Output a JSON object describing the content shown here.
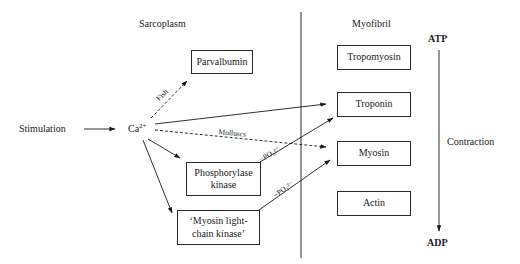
{
  "diagram": {
    "regions": {
      "left": "Sarcoplasm",
      "right": "Myofibril"
    },
    "start_node": "Stimulation",
    "calcium": {
      "base": "Ca",
      "charge": "2+"
    },
    "sarcoplasm_nodes": {
      "parvalbumin": "Parvalbumin",
      "phosphorylase_kinase": [
        "Phosphorylase",
        "kinase"
      ],
      "mlck": [
        "‘Myosin light-",
        "chain kinase’"
      ]
    },
    "myofibril_nodes": {
      "tropomyosin": "Tropomyosin",
      "troponin": "Troponin",
      "myosin": "Myosin",
      "actin": "Actin"
    },
    "edge_labels": {
      "fish": "Fish",
      "molluscs": "Molluscs",
      "phosphate_1": "−PO₃²⁻",
      "phosphate_2": "−PO₃²⁻"
    },
    "energy_axis": {
      "top": "ATP",
      "bottom": "ADP",
      "label": "Contraction"
    },
    "edges": [
      {
        "from": "Stimulation",
        "to": "Ca2+",
        "style": "solid"
      },
      {
        "from": "Ca2+",
        "to": "Parvalbumin",
        "style": "dashed",
        "label": "Fish"
      },
      {
        "from": "Ca2+",
        "to": "Troponin",
        "style": "solid"
      },
      {
        "from": "Ca2+",
        "to": "Myosin",
        "style": "dashed",
        "label": "Molluscs"
      },
      {
        "from": "Ca2+",
        "to": "Phosphorylase kinase",
        "style": "solid"
      },
      {
        "from": "Ca2+",
        "to": "Myosin light-chain kinase",
        "style": "solid"
      },
      {
        "from": "Phosphorylase kinase",
        "to": "Troponin",
        "style": "solid",
        "label": "−PO₃²⁻"
      },
      {
        "from": "Myosin light-chain kinase",
        "to": "Myosin",
        "style": "solid",
        "label": "−PO₃²⁻"
      },
      {
        "from": "ATP",
        "to": "ADP",
        "style": "solid",
        "label": "Contraction"
      }
    ],
    "colors": {
      "ink": "#1a1a1a",
      "background": "#ffffff"
    }
  }
}
